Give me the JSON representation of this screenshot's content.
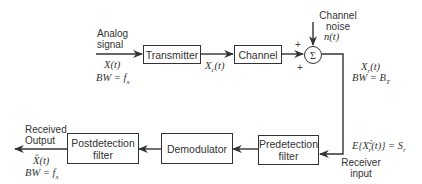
{
  "blocks": {
    "transmitter": "Transmitter",
    "channel": "Channel",
    "predetection_filter": [
      "Predetection",
      "filter"
    ],
    "demodulator": "Demodulator",
    "postdetection_filter": [
      "Postdetection",
      "filter"
    ]
  },
  "summer": {
    "symbol": "Σ",
    "signs": [
      "+",
      "+"
    ]
  },
  "labels": {
    "input": [
      "Analog",
      "signal"
    ],
    "input_signal": "X(t)",
    "input_bw": "BW = f",
    "input_bw_sub": "x",
    "tx_output": "X",
    "tx_output_sub": "c",
    "tx_output_arg": "(t)",
    "noise": [
      "Channel",
      "noise"
    ],
    "noise_signal": "n(t)",
    "rx_signal": "X",
    "rx_signal_sub": "r",
    "rx_signal_arg": "(t)",
    "rx_bw": "BW = B",
    "rx_bw_sub": "T",
    "power_eq": "E{X",
    "power_eq_sub": "r",
    "power_eq_sup": "2",
    "power_eq_rest": "(t)} = S",
    "power_eq_sub2": "r",
    "receiver_input": [
      "Receiver",
      "input"
    ],
    "output": [
      "Received",
      "Output"
    ],
    "output_signal": "X̂(t)",
    "output_bw": "BW = f",
    "output_bw_sub": "x"
  }
}
